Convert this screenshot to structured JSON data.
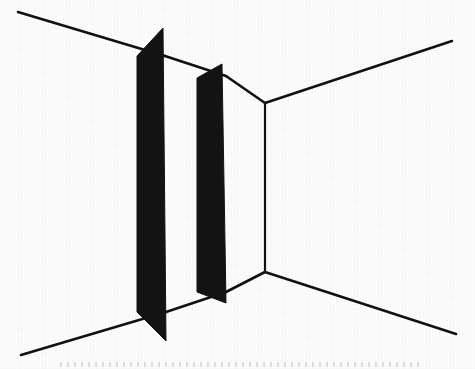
{
  "figure": {
    "background_color": "#ffffff",
    "ink_color": "#111111",
    "panel_fill": "#131313",
    "line_width": 2.4,
    "canvas": {
      "width": 475,
      "height": 369
    },
    "elements": {
      "corner_vertical_label": "corner-edge",
      "ceiling_left_label": "ceiling-line-left",
      "ceiling_right_label": "ceiling-line-right",
      "floor_left_label": "floor-line-left",
      "floor_right_label": "floor-line-right",
      "panel_front_label": "front-panel",
      "panel_back_label": "back-panel"
    }
  },
  "geometry": {
    "corner_top": {
      "x": 265,
      "y": 103
    },
    "corner_bottom": {
      "x": 265,
      "y": 272
    },
    "ceiling_left_start": {
      "x": 18,
      "y": 12
    },
    "ceiling_left_end": {
      "x": 165,
      "y": 56
    },
    "ceiling_mid_start": {
      "x": 165,
      "y": 56
    },
    "ceiling_mid_end": {
      "x": 226,
      "y": 76
    },
    "ceiling_inner_start": {
      "x": 226,
      "y": 76
    },
    "ceiling_inner_end": {
      "x": 265,
      "y": 103
    },
    "ceiling_right_start": {
      "x": 265,
      "y": 103
    },
    "ceiling_right_end": {
      "x": 452,
      "y": 41
    },
    "floor_left_start": {
      "x": 21,
      "y": 355
    },
    "floor_left_end": {
      "x": 166,
      "y": 312
    },
    "floor_mid_start": {
      "x": 166,
      "y": 312
    },
    "floor_mid_end": {
      "x": 226,
      "y": 292
    },
    "floor_inner_start": {
      "x": 226,
      "y": 292
    },
    "floor_inner_end": {
      "x": 265,
      "y": 272
    },
    "floor_right_start": {
      "x": 265,
      "y": 272
    },
    "floor_right_end": {
      "x": 456,
      "y": 334
    },
    "front_panel_points": "137,56 163,28 166,341 137,312",
    "back_panel_points": "197,78 222,64 226,303 197,292"
  },
  "chart_data": {
    "type": "line",
    "series": [
      {
        "name": "ceiling-line-left",
        "x": [
          18,
          165
        ],
        "y": [
          12,
          56
        ]
      },
      {
        "name": "ceiling-line-mid",
        "x": [
          165,
          226
        ],
        "y": [
          56,
          76
        ]
      },
      {
        "name": "ceiling-line-inner",
        "x": [
          226,
          265
        ],
        "y": [
          76,
          103
        ]
      },
      {
        "name": "ceiling-line-right",
        "x": [
          265,
          452
        ],
        "y": [
          103,
          41
        ]
      },
      {
        "name": "corner-edge",
        "x": [
          265,
          265
        ],
        "y": [
          103,
          272
        ]
      },
      {
        "name": "floor-line-left",
        "x": [
          21,
          166
        ],
        "y": [
          355,
          312
        ]
      },
      {
        "name": "floor-line-mid",
        "x": [
          166,
          226
        ],
        "y": [
          312,
          292
        ]
      },
      {
        "name": "floor-line-inner",
        "x": [
          226,
          265
        ],
        "y": [
          292,
          272
        ]
      },
      {
        "name": "floor-line-right",
        "x": [
          265,
          456
        ],
        "y": [
          272,
          334
        ]
      }
    ],
    "xlabel": "",
    "ylabel": "",
    "xlim": [
      0,
      475
    ],
    "ylim": [
      0,
      369
    ],
    "grid": false,
    "legend": "none"
  }
}
